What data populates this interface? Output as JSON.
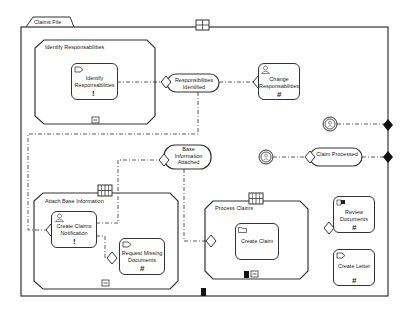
{
  "diagram": {
    "pool": {
      "label": "Claims File"
    },
    "subprocesses": [
      {
        "id": "identify",
        "label": "Identify Responsabilities"
      },
      {
        "id": "attach",
        "label": "Attach Base Information"
      },
      {
        "id": "process",
        "label": "Process Claims"
      }
    ],
    "tasks": [
      {
        "id": "t1",
        "label": "Identify Responsabilities",
        "icon": "send-message-icon",
        "marker": "!"
      },
      {
        "id": "t2",
        "label": "Change Responsabilities",
        "icon": "user-icon",
        "marker": "#"
      },
      {
        "id": "t3",
        "label": "Create Claims Notification",
        "icon": "user-icon",
        "marker": "!"
      },
      {
        "id": "t4",
        "label": "Request Missing Documents",
        "icon": "send-message-icon",
        "marker": "#"
      },
      {
        "id": "t5",
        "label": "Create Claim",
        "icon": "folder-icon",
        "marker": ""
      },
      {
        "id": "t6",
        "label": "Review Documents",
        "icon": "manual-task-icon",
        "marker": "#"
      },
      {
        "id": "t7",
        "label": "Create Letter",
        "icon": "send-message-icon",
        "marker": "#"
      }
    ],
    "states": [
      {
        "id": "s1",
        "label": "Responsibilities Identified"
      },
      {
        "id": "s2",
        "label": "Base Information Attached"
      },
      {
        "id": "s3",
        "label": "Claim Processed"
      }
    ],
    "colors": {
      "stroke": "#333333",
      "background": "#ffffff",
      "fill": "#111111"
    }
  }
}
